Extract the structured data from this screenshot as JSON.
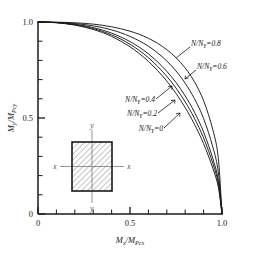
{
  "chart_data": {
    "type": "line",
    "title": "",
    "subtitle": "",
    "xlabel": "Mx/MPcx",
    "ylabel": "My/MPcy",
    "xlim": [
      0,
      1.0
    ],
    "ylim": [
      0,
      1.0
    ],
    "grid": false,
    "legend_position": "inline-annotations",
    "x_ticks_major": [
      "0",
      "0.5",
      "1.0"
    ],
    "x_ticks_major_values": [
      0,
      0.5,
      1.0
    ],
    "x_ticks_minor_values": [
      0.1,
      0.2,
      0.3,
      0.4,
      0.6,
      0.7,
      0.8,
      0.9
    ],
    "y_ticks_major": [
      "0",
      "0.5",
      "1.0"
    ],
    "y_ticks_major_values": [
      0,
      0.5,
      1.0
    ],
    "y_ticks_minor_values": [
      0.1,
      0.2,
      0.3,
      0.4,
      0.6,
      0.7,
      0.8,
      0.9
    ],
    "series": [
      {
        "name": "N/NY=0",
        "label": "N/NY=0",
        "x": [
          0.0,
          0.05,
          0.1,
          0.15,
          0.2,
          0.25,
          0.3,
          0.35,
          0.4,
          0.45,
          0.5,
          0.55,
          0.6,
          0.65,
          0.7,
          0.75,
          0.8,
          0.85,
          0.9,
          0.95,
          0.98,
          1.0
        ],
        "y": [
          1.0,
          0.999,
          0.996,
          0.991,
          0.984,
          0.974,
          0.961,
          0.945,
          0.925,
          0.9,
          0.871,
          0.836,
          0.795,
          0.747,
          0.692,
          0.628,
          0.554,
          0.468,
          0.366,
          0.239,
          0.14,
          0.0
        ]
      },
      {
        "name": "N/NY=0.2",
        "label": "N/NY=0.2",
        "x": [
          0.0,
          0.05,
          0.1,
          0.15,
          0.2,
          0.25,
          0.3,
          0.35,
          0.4,
          0.45,
          0.5,
          0.55,
          0.6,
          0.65,
          0.7,
          0.75,
          0.8,
          0.85,
          0.9,
          0.95,
          0.98,
          1.0
        ],
        "y": [
          1.0,
          0.999,
          0.997,
          0.992,
          0.986,
          0.977,
          0.966,
          0.951,
          0.933,
          0.911,
          0.884,
          0.852,
          0.814,
          0.769,
          0.717,
          0.656,
          0.584,
          0.499,
          0.396,
          0.264,
          0.158,
          0.0
        ]
      },
      {
        "name": "N/NY=0.4",
        "label": "N/NY=0.4",
        "x": [
          0.0,
          0.05,
          0.1,
          0.15,
          0.2,
          0.25,
          0.3,
          0.35,
          0.4,
          0.45,
          0.5,
          0.55,
          0.6,
          0.65,
          0.7,
          0.75,
          0.8,
          0.85,
          0.9,
          0.95,
          0.98,
          1.0
        ],
        "y": [
          1.0,
          0.999,
          0.997,
          0.993,
          0.988,
          0.981,
          0.971,
          0.958,
          0.942,
          0.922,
          0.898,
          0.869,
          0.834,
          0.792,
          0.743,
          0.685,
          0.615,
          0.531,
          0.427,
          0.289,
          0.175,
          0.0
        ]
      },
      {
        "name": "N/NY=0.6",
        "label": "N/NY=0.6",
        "x": [
          0.0,
          0.05,
          0.1,
          0.15,
          0.2,
          0.25,
          0.3,
          0.35,
          0.4,
          0.45,
          0.5,
          0.55,
          0.6,
          0.65,
          0.7,
          0.75,
          0.8,
          0.85,
          0.9,
          0.95,
          0.98,
          1.0
        ],
        "y": [
          1.0,
          1.0,
          0.998,
          0.996,
          0.992,
          0.987,
          0.98,
          0.971,
          0.959,
          0.944,
          0.925,
          0.902,
          0.874,
          0.839,
          0.797,
          0.745,
          0.681,
          0.601,
          0.497,
          0.35,
          0.218,
          0.0
        ]
      },
      {
        "name": "N/NY=0.8",
        "label": "N/NY=0.8",
        "x": [
          0.0,
          0.05,
          0.1,
          0.15,
          0.2,
          0.25,
          0.3,
          0.35,
          0.4,
          0.45,
          0.5,
          0.55,
          0.6,
          0.65,
          0.7,
          0.75,
          0.8,
          0.85,
          0.9,
          0.95,
          0.98,
          1.0
        ],
        "y": [
          1.0,
          1.0,
          0.999,
          0.998,
          0.996,
          0.993,
          0.989,
          0.983,
          0.975,
          0.965,
          0.952,
          0.936,
          0.915,
          0.889,
          0.856,
          0.814,
          0.76,
          0.689,
          0.59,
          0.44,
          0.29,
          0.0
        ]
      }
    ],
    "annotations": [
      {
        "text": "N/NY=0.8",
        "num": "0.8"
      },
      {
        "text": "N/NY=0.6",
        "num": "0.6"
      },
      {
        "text": "N/NY=0.4",
        "num": "0.4"
      },
      {
        "text": "N/NY=0.2",
        "num": "0.2"
      },
      {
        "text": "N/NY=0",
        "num": "0"
      }
    ],
    "colors": {
      "curve": "#1a1a1a",
      "axis": "#1a1a1a",
      "text": "#1a1a1a",
      "inset_line": "#6e6e6e",
      "background": "#ffffff"
    }
  },
  "axes": {
    "x_label_num": "M",
    "x_label_num_sub": "x",
    "x_label_den": "M",
    "x_label_den_sub": "Pcx",
    "y_label_num": "M",
    "y_label_num_sub": "y",
    "y_label_den": "M",
    "y_label_den_sub": "Pcy",
    "x_tick_0": "0",
    "x_tick_1": "0.5",
    "x_tick_2": "1.0",
    "y_tick_0": "0",
    "y_tick_1": "0.5",
    "y_tick_2": "1.0"
  },
  "curve_labels": {
    "l08_prefix": "N/N",
    "l08_sub": "Y",
    "l08_value": "=0.8",
    "l06_prefix": "N/N",
    "l06_sub": "Y",
    "l06_value": "=0.6",
    "l04_prefix": "N/N",
    "l04_sub": "Y",
    "l04_value": "=0.4",
    "l02_prefix": "N/N",
    "l02_sub": "Y",
    "l02_value": "=0.2",
    "l00_prefix": "N/N",
    "l00_sub": "Y",
    "l00_value": "=0"
  },
  "inset": {
    "axis_x_left": "x",
    "axis_x_right": "x",
    "axis_y_top": "y",
    "axis_y_bottom": "y",
    "shape": "hatched-rectangle-cross-section"
  }
}
